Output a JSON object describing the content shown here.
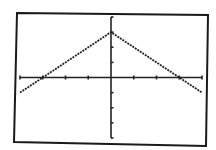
{
  "screen": {
    "frame_color": "#1a1a1a",
    "background": "#ffffff",
    "plot_color": "#222222"
  },
  "chart_data": {
    "type": "line",
    "title": "",
    "xlabel": "",
    "ylabel": "",
    "function": "y = 3 - |x|",
    "xlim": [
      -4,
      4
    ],
    "ylim": [
      -4,
      4
    ],
    "xscl": 1,
    "yscl": 1,
    "grid": false,
    "legend": null,
    "x": [
      -4,
      -3,
      -2,
      -1,
      0,
      1,
      2,
      3,
      4
    ],
    "series": [
      {
        "name": "Y1",
        "values": [
          -1,
          0,
          1,
          2,
          3,
          2,
          1,
          0,
          -1
        ]
      }
    ],
    "annotations": []
  }
}
